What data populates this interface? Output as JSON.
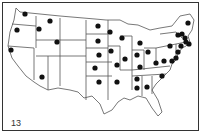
{
  "map": {
    "subject": "United States state outline map with marked states",
    "figure_label": "13",
    "colors": {
      "outline": "#555555",
      "dot": "#111111",
      "background": "#ffffff"
    },
    "marked_locations": [
      {
        "state": "WA",
        "x": 25,
        "y": 14
      },
      {
        "state": "OR",
        "x": 17,
        "y": 30
      },
      {
        "state": "CA",
        "x": 11,
        "y": 50
      },
      {
        "state": "ID",
        "x": 39,
        "y": 29
      },
      {
        "state": "MT",
        "x": 50,
        "y": 21
      },
      {
        "state": "WY",
        "x": 57,
        "y": 42
      },
      {
        "state": "AZ",
        "x": 42,
        "y": 77
      },
      {
        "state": "ND",
        "x": 98,
        "y": 26
      },
      {
        "state": "SD",
        "x": 98,
        "y": 41
      },
      {
        "state": "NE",
        "x": 99,
        "y": 55
      },
      {
        "state": "KS",
        "x": 95,
        "y": 68
      },
      {
        "state": "OK",
        "x": 99,
        "y": 82
      },
      {
        "state": "MN",
        "x": 110,
        "y": 32
      },
      {
        "state": "IA",
        "x": 111,
        "y": 51
      },
      {
        "state": "MO",
        "x": 117,
        "y": 65
      },
      {
        "state": "AR",
        "x": 117,
        "y": 82
      },
      {
        "state": "WI",
        "x": 122,
        "y": 38
      },
      {
        "state": "IL",
        "x": 125,
        "y": 59
      },
      {
        "state": "MI",
        "x": 140,
        "y": 43
      },
      {
        "state": "IN",
        "x": 137,
        "y": 55
      },
      {
        "state": "OH",
        "x": 148,
        "y": 52
      },
      {
        "state": "KY",
        "x": 140,
        "y": 67
      },
      {
        "state": "TN",
        "x": 137,
        "y": 79
      },
      {
        "state": "MS",
        "x": 137,
        "y": 88
      },
      {
        "state": "AL",
        "x": 147,
        "y": 87
      },
      {
        "state": "WV",
        "x": 156,
        "y": 63
      },
      {
        "state": "VA",
        "x": 164,
        "y": 61
      },
      {
        "state": "NC",
        "x": 162,
        "y": 76
      },
      {
        "state": "PA",
        "x": 170,
        "y": 46
      },
      {
        "state": "NY",
        "x": 178,
        "y": 35
      },
      {
        "state": "MD",
        "x": 172,
        "y": 61
      },
      {
        "state": "DE",
        "x": 176,
        "y": 58
      },
      {
        "state": "NJ",
        "x": 178,
        "y": 52
      },
      {
        "state": "CT",
        "x": 181,
        "y": 46
      },
      {
        "state": "RI",
        "x": 189,
        "y": 44
      },
      {
        "state": "MA",
        "x": 186,
        "y": 42
      },
      {
        "state": "VT",
        "x": 182,
        "y": 34
      },
      {
        "state": "NH",
        "x": 185,
        "y": 38
      },
      {
        "state": "ME",
        "x": 188,
        "y": 23
      }
    ]
  }
}
